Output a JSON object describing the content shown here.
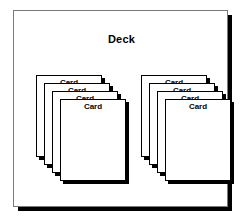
{
  "diagram": {
    "type": "uml-object-stack-diagram",
    "container": {
      "label": "Deck",
      "border_color": "#7a7a7a",
      "fill_color": "#ffffff",
      "shadow_color": "#000000"
    },
    "card_label": "Card",
    "stacks": [
      {
        "name": "left-card-stack",
        "cards": [
          {
            "label": "Card"
          },
          {
            "label": "Card"
          },
          {
            "label": "Card"
          },
          {
            "label": "Card"
          }
        ]
      },
      {
        "name": "right-card-stack",
        "cards": [
          {
            "label": "Card"
          },
          {
            "label": "Card"
          },
          {
            "label": "Card"
          },
          {
            "label": "Card"
          }
        ]
      }
    ],
    "colors": {
      "background": "#ffffff",
      "card_fill": "#ffffff",
      "card_border": "#000000",
      "text": "#000000"
    }
  }
}
